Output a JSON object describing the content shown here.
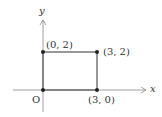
{
  "diagram": {
    "axes": {
      "x_label": "x",
      "y_label": "y",
      "origin_label": "O"
    },
    "points": [
      {
        "label": "(0, 2)",
        "x": 0,
        "y": 2
      },
      {
        "label": "(3, 2)",
        "x": 3,
        "y": 2
      },
      {
        "label": "(3, 0)",
        "x": 3,
        "y": 0
      },
      {
        "label": "O",
        "x": 0,
        "y": 0
      }
    ],
    "shape": "rectangle",
    "colors": {
      "line": "#555555",
      "point": "#222222",
      "axis": "#777777"
    }
  }
}
